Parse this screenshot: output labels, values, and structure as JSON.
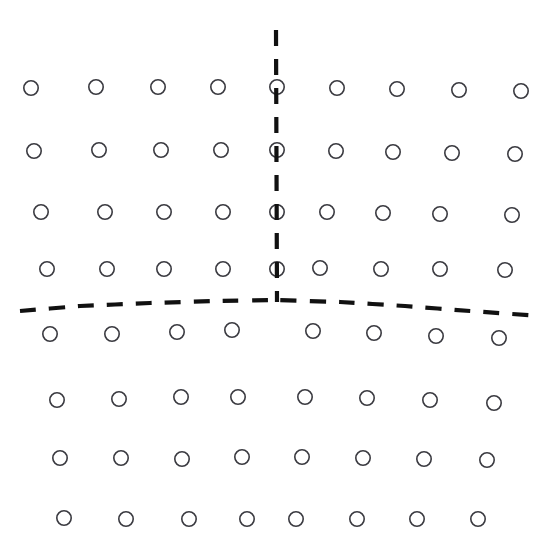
{
  "figure": {
    "type": "scatter",
    "title": "",
    "width": 549,
    "height": 549,
    "background_color": "#ffffff"
  },
  "style": {
    "dot_stroke_color": "#3a3a40",
    "dot_fill": "none",
    "dot_stroke_width": 1.6,
    "dot_radius": 7.2,
    "axis_color": "#111111",
    "axis_stroke_width": 4.2,
    "axis_dash_pattern": "16 13"
  },
  "axes": {
    "vertical_divider": {
      "name": "vertical-dashed-divider",
      "x_top": 276,
      "y_top": 30,
      "x_bottom": 277,
      "y_bottom": 302,
      "orientation": "vertical",
      "dash": true
    },
    "horizontal_divider": {
      "name": "horizontal-dashed-divider",
      "orientation": "horizontal",
      "dash": true,
      "curve_points": [
        [
          20,
          311
        ],
        [
          80,
          306
        ],
        [
          150,
          303
        ],
        [
          215,
          301
        ],
        [
          277,
          300
        ],
        [
          340,
          302
        ],
        [
          405,
          306
        ],
        [
          470,
          311
        ],
        [
          540,
          316
        ]
      ]
    }
  },
  "chart_data": {
    "type": "scatter",
    "title": "",
    "xlabel": "",
    "ylabel": "",
    "xlim": [
      0,
      549
    ],
    "ylim": [
      0,
      549
    ],
    "grid": false,
    "legend": null,
    "marker": "open-circle",
    "row_count": 9,
    "total_points": 73,
    "rows": [
      {
        "row_index": 0,
        "label": "row-1",
        "point_count": 9,
        "points": [
          [
            31,
            88
          ],
          [
            96,
            87
          ],
          [
            158,
            87
          ],
          [
            218,
            87
          ],
          [
            277,
            87
          ],
          [
            337,
            88
          ],
          [
            397,
            89
          ],
          [
            459,
            90
          ],
          [
            521,
            91
          ]
        ]
      },
      {
        "row_index": 1,
        "label": "row-2",
        "point_count": 9,
        "points": [
          [
            34,
            151
          ],
          [
            99,
            150
          ],
          [
            161,
            150
          ],
          [
            221,
            150
          ],
          [
            277,
            150
          ],
          [
            336,
            151
          ],
          [
            393,
            152
          ],
          [
            452,
            153
          ],
          [
            515,
            154
          ]
        ]
      },
      {
        "row_index": 2,
        "label": "row-3",
        "point_count": 9,
        "points": [
          [
            41,
            212
          ],
          [
            105,
            212
          ],
          [
            164,
            212
          ],
          [
            223,
            212
          ],
          [
            277,
            212
          ],
          [
            327,
            212
          ],
          [
            383,
            213
          ],
          [
            440,
            214
          ],
          [
            512,
            215
          ]
        ]
      },
      {
        "row_index": 3,
        "label": "row-4",
        "point_count": 9,
        "points": [
          [
            47,
            269
          ],
          [
            107,
            269
          ],
          [
            164,
            269
          ],
          [
            223,
            269
          ],
          [
            277,
            269
          ],
          [
            320,
            268
          ],
          [
            381,
            269
          ],
          [
            440,
            269
          ],
          [
            505,
            270
          ]
        ]
      },
      {
        "row_index": 4,
        "label": "row-5",
        "point_count": 8,
        "points": [
          [
            50,
            334
          ],
          [
            112,
            334
          ],
          [
            177,
            332
          ],
          [
            232,
            330
          ],
          [
            313,
            331
          ],
          [
            374,
            333
          ],
          [
            436,
            336
          ],
          [
            499,
            338
          ]
        ]
      },
      {
        "row_index": 5,
        "label": "row-6",
        "point_count": 8,
        "points": [
          [
            57,
            400
          ],
          [
            119,
            399
          ],
          [
            181,
            397
          ],
          [
            238,
            397
          ],
          [
            305,
            397
          ],
          [
            367,
            398
          ],
          [
            430,
            400
          ],
          [
            494,
            403
          ]
        ]
      },
      {
        "row_index": 6,
        "label": "row-7",
        "point_count": 8,
        "points": [
          [
            60,
            458
          ],
          [
            121,
            458
          ],
          [
            182,
            459
          ],
          [
            242,
            457
          ],
          [
            302,
            457
          ],
          [
            363,
            458
          ],
          [
            424,
            459
          ],
          [
            487,
            460
          ]
        ]
      },
      {
        "row_index": 7,
        "label": "row-8",
        "point_count": 8,
        "points": [
          [
            64,
            518
          ],
          [
            126,
            519
          ],
          [
            189,
            519
          ],
          [
            247,
            519
          ],
          [
            296,
            519
          ],
          [
            357,
            519
          ],
          [
            417,
            519
          ],
          [
            478,
            519
          ]
        ]
      }
    ]
  }
}
